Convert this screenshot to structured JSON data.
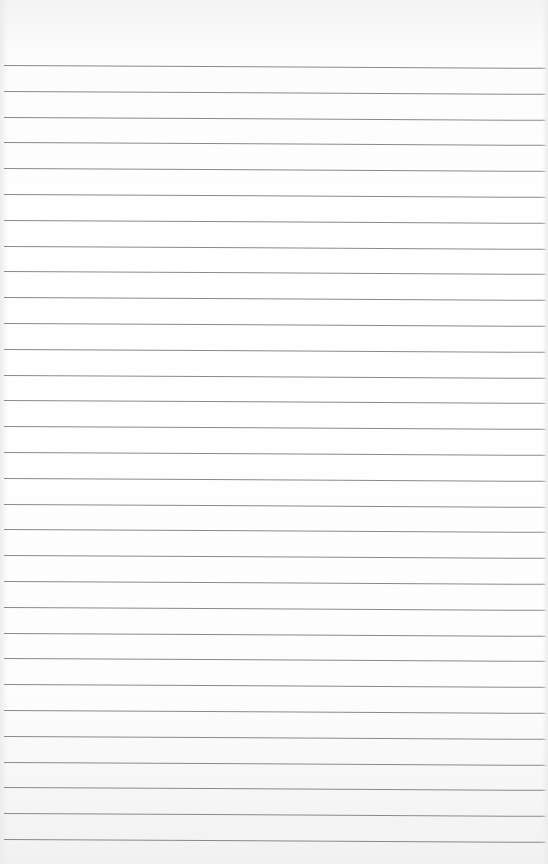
{
  "paper": {
    "type": "lined-sheet",
    "line_count": 31,
    "first_line_y": 65,
    "line_spacing_px": 25.8,
    "line_color": "#8a8a8a",
    "background_color": "#ffffff"
  }
}
